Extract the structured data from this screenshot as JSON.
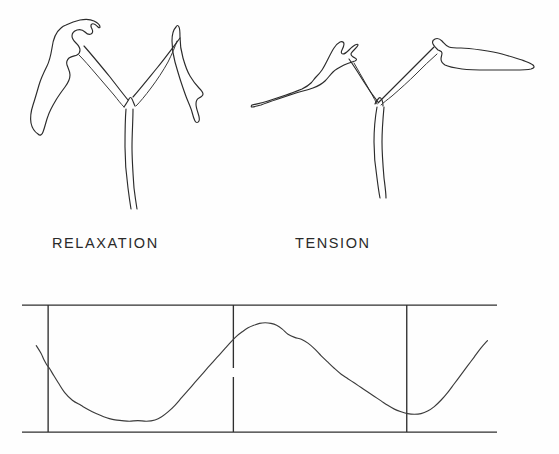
{
  "figure": {
    "background_color": "#fefefe",
    "ink_color": "#2b2b2b",
    "caption_color": "#2a2a2a"
  },
  "drawings": {
    "left": {
      "label": "RELAXATION",
      "description": "line drawing of a trifid plant organ with two lobes angled upward and a central stalk"
    },
    "right": {
      "label": "TENSION",
      "description": "line drawing of the same trifid plant organ with two lobes spread horizontally and a central stalk"
    }
  },
  "labels": {
    "relaxation": "RELAXATION",
    "tension": "TENSION"
  },
  "chart_data": {
    "type": "line",
    "title": "",
    "xlabel": "",
    "ylabel": "",
    "grid": false,
    "legend": null,
    "xlim": [
      0,
      100
    ],
    "ylim": [
      0,
      100
    ],
    "axis_ticks_x": [
      5.5,
      44.5,
      81.0
    ],
    "frame": {
      "top_y": 100,
      "bottom_y": 0,
      "left_x": 0.5,
      "right_x": 100
    },
    "series": [
      {
        "name": "trace",
        "x": [
          3.0,
          4.0,
          4.6,
          5.2,
          5.8,
          6.6,
          7.6,
          9.0,
          10.6,
          12.4,
          14.0,
          15.6,
          17.2,
          18.4,
          19.6,
          21.0,
          22.6,
          24.4,
          26.2,
          28.0,
          29.4,
          30.8,
          32.2,
          33.6,
          35.0,
          36.4,
          37.8,
          39.2,
          40.4,
          41.6,
          42.8,
          44.0,
          45.2,
          46.4,
          47.6,
          48.8,
          50.0,
          51.2,
          52.4,
          53.6,
          54.8,
          56.0,
          57.4,
          58.8,
          60.2,
          61.6,
          63.0,
          64.4,
          65.8,
          67.2,
          68.6,
          70.0,
          71.4,
          72.8,
          74.2,
          75.6,
          77.0,
          78.4,
          79.8,
          81.2,
          82.6,
          84.0,
          85.4,
          86.8,
          88.2,
          89.6,
          91.0,
          92.4,
          93.8,
          95.2,
          96.6,
          98.0
        ],
        "y": [
          68.0,
          62.0,
          57.0,
          53.0,
          50.0,
          45.0,
          39.0,
          31.0,
          25.0,
          21.0,
          17.5,
          14.5,
          12.0,
          10.5,
          9.5,
          9.0,
          8.5,
          9.0,
          8.5,
          9.5,
          12.0,
          16.0,
          21.0,
          27.0,
          33.0,
          39.0,
          45.0,
          51.0,
          56.0,
          61.0,
          66.0,
          71.0,
          75.5,
          79.0,
          82.0,
          84.0,
          85.5,
          86.0,
          85.5,
          84.0,
          81.0,
          77.0,
          74.5,
          73.0,
          70.0,
          65.5,
          60.0,
          55.0,
          50.0,
          45.5,
          42.0,
          38.5,
          35.0,
          31.5,
          28.0,
          24.5,
          21.0,
          18.0,
          16.0,
          14.5,
          14.0,
          14.5,
          16.5,
          20.0,
          25.0,
          31.0,
          38.0,
          45.0,
          52.0,
          59.0,
          66.0,
          72.0
        ]
      }
    ],
    "annotations": [
      {
        "name": "cycle-marker-1",
        "x": 5.5
      },
      {
        "name": "cycle-marker-2",
        "x": 44.5
      },
      {
        "name": "cycle-marker-3",
        "x": 81.0
      }
    ]
  }
}
